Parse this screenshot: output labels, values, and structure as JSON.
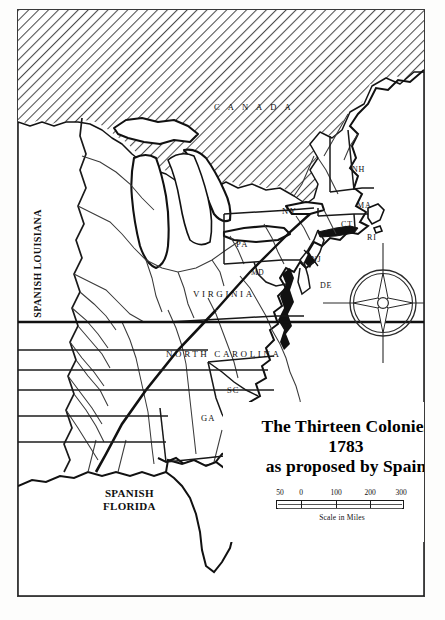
{
  "map": {
    "title_lines": [
      "The Thirteen Colonies",
      "1783",
      "as proposed by Spain"
    ],
    "regions": {
      "canada": "C A N A D A",
      "spanish_louisiana": "SPANISH LOUISIANA",
      "spanish_florida_line1": "SPANISH",
      "spanish_florida_line2": "FLORIDA",
      "virginia": "VIRGINIA",
      "north_carolina": "NORTH CAROLINA"
    },
    "state_labels": [
      {
        "code": "NY",
        "name": "New York"
      },
      {
        "code": "PA",
        "name": "Pennsylvania"
      },
      {
        "code": "NJ",
        "name": "New Jersey"
      },
      {
        "code": "MD",
        "name": "Maryland"
      },
      {
        "code": "DE",
        "name": "Delaware"
      },
      {
        "code": "NH",
        "name": "New Hampshire"
      },
      {
        "code": "MA",
        "name": "Massachusetts"
      },
      {
        "code": "CT",
        "name": "Connecticut"
      },
      {
        "code": "RI",
        "name": "Rhode Island"
      },
      {
        "code": "SC",
        "name": "South Carolina"
      },
      {
        "code": "GA",
        "name": "Georgia"
      }
    ],
    "scale": {
      "ticks": [
        "50",
        "0",
        "100",
        "200",
        "300"
      ],
      "caption": "Scale in Miles",
      "units": "miles"
    },
    "compass": {
      "name": "compass-rose"
    },
    "colors": {
      "ink": "#101010",
      "frame": "#3a3a3a",
      "paper": "#ffffff",
      "hatch": "#4a4a4a"
    }
  }
}
